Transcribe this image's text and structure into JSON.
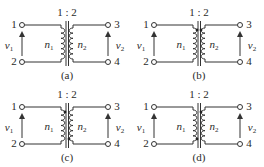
{
  "diagram": {
    "type": "ideal transformer circuit options",
    "ratio_label": "1 : 2",
    "primary_label": "n",
    "primary_sub": "1",
    "secondary_label": "n",
    "secondary_sub": "2",
    "v1_label": "v",
    "v1_sub": "1",
    "v2_label": "v",
    "v2_sub": "2",
    "terminals": [
      "1",
      "2",
      "3",
      "4"
    ],
    "stroke_color": "#333333",
    "panels": [
      {
        "id": "a",
        "caption": "(a)",
        "primary_dot": "none",
        "secondary_dot": "none"
      },
      {
        "id": "b",
        "caption": "(b)",
        "primary_dot": "top",
        "secondary_dot": "top"
      },
      {
        "id": "c",
        "caption": "(c)",
        "primary_dot": "top",
        "secondary_dot": "bottom"
      },
      {
        "id": "d",
        "caption": "(d)",
        "primary_dot": "bottom",
        "secondary_dot": "top"
      }
    ]
  }
}
